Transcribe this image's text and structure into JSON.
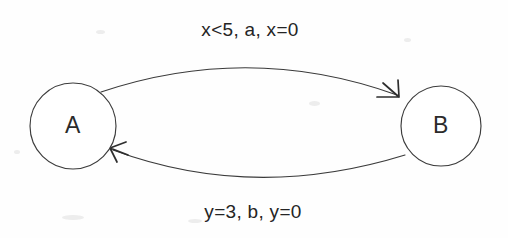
{
  "diagram": {
    "type": "state-transition-diagram",
    "background_color": "#fefefe",
    "stroke_color": "#3a3a3a",
    "text_color": "#242424",
    "width": 508,
    "height": 238,
    "states": [
      {
        "id": "A",
        "label": "A",
        "cx": 73,
        "cy": 126,
        "r": 43
      },
      {
        "id": "B",
        "label": "B",
        "cx": 441,
        "cy": 126,
        "r": 40
      }
    ],
    "transitions": [
      {
        "id": "a-to-b",
        "from": "A",
        "to": "B",
        "label": "x<5, a, x=0",
        "label_x": 250,
        "label_y": 31,
        "position": "top",
        "guard": "x<5",
        "event": "a",
        "action": "x=0"
      },
      {
        "id": "b-to-a",
        "from": "B",
        "to": "A",
        "label": "y=3, b, y=0",
        "label_x": 253,
        "label_y": 213,
        "position": "bottom",
        "guard": "y=3",
        "event": "b",
        "action": "y=0"
      }
    ]
  }
}
